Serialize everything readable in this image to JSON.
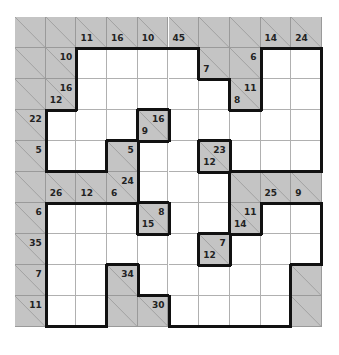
{
  "puzzle": {
    "type": "kakuro",
    "rows": 10,
    "cols": 10,
    "colors": {
      "clue_cell": "#c4c4c4",
      "entry_cell": "#ffffff",
      "border": "#111111"
    },
    "grid": [
      [
        {
          "t": "b"
        },
        {
          "t": "b"
        },
        {
          "t": "b",
          "d": "11"
        },
        {
          "t": "b",
          "d": "16"
        },
        {
          "t": "b",
          "d": "10"
        },
        {
          "t": "b",
          "d": "45"
        },
        {
          "t": "b"
        },
        {
          "t": "b"
        },
        {
          "t": "b",
          "d": "14"
        },
        {
          "t": "b",
          "d": "24"
        }
      ],
      [
        {
          "t": "b"
        },
        {
          "t": "b",
          "r": "10"
        },
        {
          "t": "w"
        },
        {
          "t": "w"
        },
        {
          "t": "w"
        },
        {
          "t": "w"
        },
        {
          "t": "b",
          "d": "7"
        },
        {
          "t": "b",
          "r": "6"
        },
        {
          "t": "w"
        },
        {
          "t": "w"
        }
      ],
      [
        {
          "t": "b"
        },
        {
          "t": "b",
          "r": "16",
          "d": "12"
        },
        {
          "t": "w"
        },
        {
          "t": "w"
        },
        {
          "t": "w"
        },
        {
          "t": "w"
        },
        {
          "t": "w"
        },
        {
          "t": "b",
          "r": "11",
          "d": "8"
        },
        {
          "t": "w"
        },
        {
          "t": "w"
        }
      ],
      [
        {
          "t": "b",
          "r": "22"
        },
        {
          "t": "w"
        },
        {
          "t": "w"
        },
        {
          "t": "w"
        },
        {
          "t": "b",
          "r": "16",
          "d": "9"
        },
        {
          "t": "w"
        },
        {
          "t": "w"
        },
        {
          "t": "w"
        },
        {
          "t": "w"
        },
        {
          "t": "w"
        }
      ],
      [
        {
          "t": "b",
          "r": "5"
        },
        {
          "t": "w"
        },
        {
          "t": "w"
        },
        {
          "t": "b",
          "r": "5"
        },
        {
          "t": "w"
        },
        {
          "t": "w"
        },
        {
          "t": "b",
          "r": "23",
          "d": "12"
        },
        {
          "t": "w"
        },
        {
          "t": "w"
        },
        {
          "t": "w"
        }
      ],
      [
        {
          "t": "b"
        },
        {
          "t": "b",
          "d": "26"
        },
        {
          "t": "b",
          "d": "12"
        },
        {
          "t": "b",
          "r": "24",
          "d": "6"
        },
        {
          "t": "w"
        },
        {
          "t": "w"
        },
        {
          "t": "w"
        },
        {
          "t": "b"
        },
        {
          "t": "b",
          "d": "25"
        },
        {
          "t": "b",
          "d": "9"
        }
      ],
      [
        {
          "t": "b",
          "r": "6"
        },
        {
          "t": "w"
        },
        {
          "t": "w"
        },
        {
          "t": "w"
        },
        {
          "t": "b",
          "r": "8",
          "d": "15"
        },
        {
          "t": "w"
        },
        {
          "t": "w"
        },
        {
          "t": "b",
          "r": "11",
          "d": "14"
        },
        {
          "t": "w"
        },
        {
          "t": "w"
        }
      ],
      [
        {
          "t": "b",
          "r": "35"
        },
        {
          "t": "w"
        },
        {
          "t": "w"
        },
        {
          "t": "w"
        },
        {
          "t": "w"
        },
        {
          "t": "w"
        },
        {
          "t": "b",
          "r": "7",
          "d": "12"
        },
        {
          "t": "w"
        },
        {
          "t": "w"
        },
        {
          "t": "w"
        }
      ],
      [
        {
          "t": "b",
          "r": "7"
        },
        {
          "t": "w"
        },
        {
          "t": "w"
        },
        {
          "t": "b",
          "r": "34"
        },
        {
          "t": "w"
        },
        {
          "t": "w"
        },
        {
          "t": "w"
        },
        {
          "t": "w"
        },
        {
          "t": "w"
        },
        {
          "t": "b"
        }
      ],
      [
        {
          "t": "b",
          "r": "11"
        },
        {
          "t": "w"
        },
        {
          "t": "w"
        },
        {
          "t": "b"
        },
        {
          "t": "b",
          "r": "30"
        },
        {
          "t": "w"
        },
        {
          "t": "w"
        },
        {
          "t": "w"
        },
        {
          "t": "w"
        },
        {
          "t": "b"
        }
      ]
    ]
  }
}
